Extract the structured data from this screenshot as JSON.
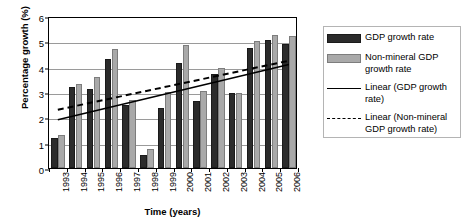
{
  "chart_data": {
    "type": "bar",
    "title": "",
    "xlabel": "Time (years)",
    "ylabel": "Percentage growth (%)",
    "categories": [
      "1993",
      "1994",
      "1995",
      "1996",
      "1997",
      "1998",
      "1999",
      "2000",
      "2001",
      "2002",
      "2003",
      "2004",
      "2005",
      "2006"
    ],
    "ylim": [
      0,
      6
    ],
    "yticks": [
      0,
      1,
      2,
      3,
      4,
      5,
      6
    ],
    "grid": true,
    "legend_position": "right",
    "series": [
      {
        "name": "GDP growth rate",
        "type": "bar",
        "color": "#2b2b2b",
        "values": [
          1.2,
          3.2,
          3.1,
          4.3,
          2.5,
          0.5,
          2.35,
          4.15,
          2.65,
          3.7,
          2.95,
          4.75,
          5.05,
          4.9
        ]
      },
      {
        "name": "Non-mineral GDP growth rate",
        "type": "bar",
        "color": "#a9a9a9",
        "values": [
          1.3,
          3.3,
          3.6,
          4.7,
          2.7,
          0.75,
          3.0,
          4.85,
          3.05,
          3.95,
          2.95,
          5.0,
          5.25,
          5.2
        ]
      },
      {
        "name": "Linear (GDP growth rate)",
        "type": "line",
        "style": "solid",
        "color": "#000000",
        "start_value": 1.95,
        "end_value": 4.15
      },
      {
        "name": "Linear (Non-mineral GDP growth rate)",
        "type": "line",
        "style": "dashed",
        "color": "#000000",
        "start_value": 2.35,
        "end_value": 4.3
      }
    ]
  },
  "legend": {
    "items": [
      {
        "label": "GDP growth rate",
        "key": "swatch-dark"
      },
      {
        "label": "Non-mineral GDP growth rate",
        "key": "swatch-light"
      },
      {
        "label": "Linear (GDP growth rate)",
        "key": "line-solid"
      },
      {
        "label": "Linear (Non-mineral GDP growth rate)",
        "key": "line-dashed"
      }
    ]
  }
}
